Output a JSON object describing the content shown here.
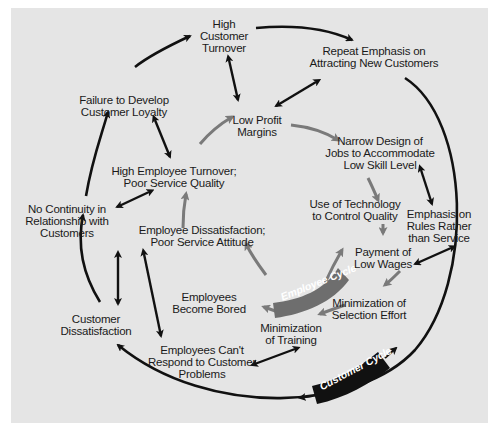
{
  "diagram": {
    "type": "cycle-of-failure",
    "colors": {
      "background": "#e5e5e5",
      "page": "#ffffff",
      "customer_cycle": "#111111",
      "employee_cycle": "#7a7a7a",
      "text": "#1a1a1a"
    },
    "badges": {
      "employee_cycle": "Employee Cycle",
      "customer_cycle": "Customer Cycle"
    },
    "nodes": {
      "high_customer_turnover": [
        "High",
        "Customer",
        "Turnover"
      ],
      "repeat_emphasis": [
        "Repeat Emphasis on",
        "Attracting New Customers"
      ],
      "failure_loyalty": [
        "Failure to Develop",
        "Customer Loyalty"
      ],
      "low_profit": [
        "Low Profit",
        "Margins"
      ],
      "narrow_design": [
        "Narrow Design of",
        "Jobs to Accommodate",
        "Low Skill Level"
      ],
      "high_employee_turnover": [
        "High Employee Turnover;",
        "Poor Service Quality"
      ],
      "no_continuity": [
        "No Continuity in",
        "Relationship with",
        "Customers"
      ],
      "use_technology": [
        "Use of Technology",
        "to Control Quality"
      ],
      "emphasis_rules": [
        "Emphasis on",
        "Rules Rather",
        "than Service"
      ],
      "employee_dissatisfaction": [
        "Employee Dissatisfaction;",
        "Poor Service Attitude"
      ],
      "payment_low_wages": [
        "Payment of",
        "Low Wages"
      ],
      "employees_bored": [
        "Employees",
        "Become Bored"
      ],
      "minimization_selection": [
        "Minimization of",
        "Selection Effort"
      ],
      "customer_dissatisfaction": [
        "Customer",
        "Dissatisfaction"
      ],
      "minimization_training": [
        "Minimization",
        "of Training"
      ],
      "employees_cant_respond": [
        "Employees Can't",
        "Respond to Customer",
        "Problems"
      ]
    },
    "edges": {
      "customer_cycle": [
        [
          "high_customer_turnover",
          "repeat_emphasis"
        ],
        [
          "repeat_emphasis",
          "customer_cycle_outer_loop"
        ],
        [
          "customer_cycle_outer_loop",
          "customer_dissatisfaction"
        ],
        [
          "customer_dissatisfaction",
          "no_continuity"
        ],
        [
          "no_continuity",
          "failure_loyalty"
        ],
        [
          "failure_loyalty",
          "high_customer_turnover"
        ]
      ],
      "employee_cycle": [
        [
          "low_profit",
          "narrow_design"
        ],
        [
          "narrow_design",
          "use_technology"
        ],
        [
          "use_technology",
          "payment_low_wages"
        ],
        [
          "payment_low_wages",
          "minimization_selection"
        ],
        [
          "minimization_selection",
          "minimization_training"
        ],
        [
          "minimization_training",
          "employees_bored"
        ],
        [
          "employees_bored",
          "employee_dissatisfaction"
        ],
        [
          "employee_dissatisfaction",
          "high_employee_turnover"
        ],
        [
          "high_employee_turnover",
          "low_profit"
        ]
      ],
      "bidirectional": [
        [
          "high_customer_turnover",
          "low_profit"
        ],
        [
          "repeat_emphasis",
          "low_profit"
        ],
        [
          "failure_loyalty",
          "high_employee_turnover"
        ],
        [
          "no_continuity",
          "high_employee_turnover"
        ],
        [
          "narrow_design",
          "emphasis_rules"
        ],
        [
          "emphasis_rules",
          "payment_low_wages"
        ],
        [
          "no_continuity",
          "customer_dissatisfaction"
        ],
        [
          "employee_dissatisfaction",
          "employees_cant_respond"
        ],
        [
          "employees_cant_respond",
          "minimization_training"
        ]
      ]
    }
  }
}
